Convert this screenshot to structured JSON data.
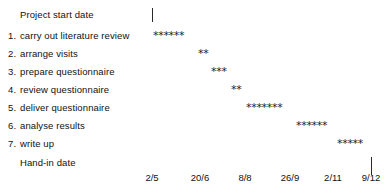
{
  "chart_data": {
    "type": "bar",
    "title": "",
    "subtitle": "",
    "xlabel": "",
    "ylabel": "",
    "orientation": "horizontal-gantt",
    "grid": false,
    "legend": null,
    "marker_glyph": "*",
    "axis_tick_labels": [
      "2/5",
      "20/6",
      "8/8",
      "26/9",
      "2/11",
      "9/12"
    ],
    "axis_tick_x": [
      152,
      200,
      245,
      290,
      333,
      371
    ],
    "markers": {
      "start": {
        "label": "Project start date",
        "x": 152
      },
      "end": {
        "label": "Hand-in date",
        "x": 371
      }
    },
    "categories": [
      "carry out literature review",
      "arrange visits",
      "prepare questionnaire",
      "review questionnaire",
      "deliver questionnaire",
      "analyse results",
      "write up"
    ],
    "values": [
      6,
      2,
      3,
      2,
      7,
      6,
      5
    ],
    "bar_start_x": [
      153,
      198,
      211,
      231,
      246,
      296,
      337
    ]
  },
  "rows": [
    {
      "num": "",
      "label": "Project start date",
      "y": 8,
      "bar": "",
      "bar_x": 0,
      "tick": true,
      "tick_x": 152,
      "tick_y": 8,
      "tick_h": 14
    },
    {
      "num": "1.",
      "label": "carry out literature review",
      "y": 29,
      "bar": "******",
      "bar_x": 153
    },
    {
      "num": "2.",
      "label": "arrange visits",
      "y": 47,
      "bar": "**",
      "bar_x": 198
    },
    {
      "num": "3.",
      "label": "prepare questionnaire",
      "y": 65,
      "bar": "***",
      "bar_x": 211
    },
    {
      "num": "4.",
      "label": "review questionnaire",
      "y": 83,
      "bar": "**",
      "bar_x": 231
    },
    {
      "num": "5.",
      "label": "deliver questionnaire",
      "y": 101,
      "bar": "*******",
      "bar_x": 246
    },
    {
      "num": "6.",
      "label": "analyse results",
      "y": 119,
      "bar": "******",
      "bar_x": 296
    },
    {
      "num": "7.",
      "label": "write up",
      "y": 137,
      "bar": "*****",
      "bar_x": 337
    },
    {
      "num": "",
      "label": "Hand-in date",
      "y": 156,
      "bar": "",
      "bar_x": 0,
      "tick": true,
      "tick_x": 371,
      "tick_y": 157,
      "tick_h": 18
    }
  ],
  "axis": {
    "y": 172,
    "ticks": [
      {
        "label": "2/5",
        "x": 152
      },
      {
        "label": "20/6",
        "x": 200
      },
      {
        "label": "8/8",
        "x": 245
      },
      {
        "label": "26/9",
        "x": 290
      },
      {
        "label": "2/11",
        "x": 333
      },
      {
        "label": "9/12",
        "x": 371
      }
    ]
  },
  "colors": {
    "background": "#ffffff",
    "text": "#111111",
    "bar": "#222222",
    "tick": "#2a2a2a"
  }
}
